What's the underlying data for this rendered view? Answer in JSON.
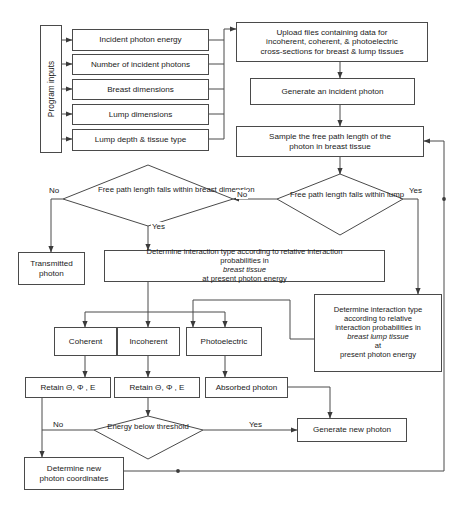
{
  "diagram": {
    "stroke_color": "#4a4a4a",
    "text_color": "#1a1a1a",
    "background": "#ffffff"
  },
  "nodes": {
    "program_inputs": "Program inputs",
    "incident_photon_energy": "Incident photon energy",
    "number_of_incident_photons": "Number of incident photons",
    "breast_dimensions": "Breast dimensions",
    "lump_dimensions": "Lump dimensions",
    "lump_depth_tissue_type": "Lump depth & tissue type",
    "upload_files_l1": "Upload files containing data for",
    "upload_files_l2": "incoherent, coherent, & photoelectric",
    "upload_files_l3": "cross-sections for breast & lump tissues",
    "generate_incident_photon": "Generate an incident photon",
    "sample_free_path_l1": "Sample the free path length of the",
    "sample_free_path_l2": "photon in breast tissue",
    "decision_breast_l1": "Free path length",
    "decision_breast_l2": "falls within",
    "decision_breast_l3": "breast dimension",
    "decision_lump_l1": "Free path length",
    "decision_lump_l2": "falls within lump",
    "transmitted_photon_l1": "Transmitted",
    "transmitted_photon_l2": "photon",
    "determine_breast_l1a": "Determine interaction type according to relative interaction",
    "determine_breast_l2a": "probabilities in ",
    "determine_breast_l2_italic": "breast tissue",
    "determine_breast_l2b": " at present photon energy",
    "determine_lump_l1": "Determine interaction type",
    "determine_lump_l2": "according to relative",
    "determine_lump_l3": "interaction probabilities in",
    "determine_lump_l4_italic": "breast lump tissue",
    "determine_lump_l4b": " at",
    "determine_lump_l5": "present photon energy",
    "coherent": "Coherent",
    "incoherent": "Incoherent",
    "photoelectric": "Photoelectric",
    "retain_coherent": "Retain Θ, Φ , E",
    "retain_incoherent": "Retain Θ, Φ , E",
    "absorbed_photon": "Absorbed photon",
    "energy_below_l1": "Energy  below",
    "energy_below_l2": "threshold",
    "generate_new_photon": "Generate new photon",
    "determine_new_coords_l1": "Determine new",
    "determine_new_coords_l2": "photon coordinates"
  },
  "edge_labels": {
    "breast_no": "No",
    "breast_yes": "Yes",
    "middle_no": "No",
    "lump_yes": "Yes",
    "energy_no": "No",
    "energy_yes": "Yes"
  }
}
